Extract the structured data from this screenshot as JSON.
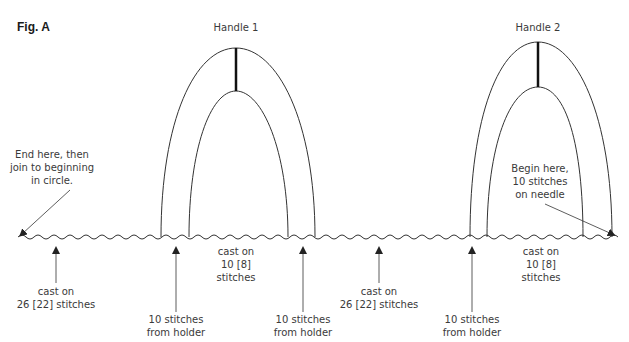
{
  "figure": {
    "label": "Fig. A",
    "handles": [
      {
        "title": "Handle 1"
      },
      {
        "title": "Handle 2"
      }
    ],
    "annotations": {
      "end": {
        "line1": "End here, then",
        "line2": "join to beginning",
        "line3": "in circle."
      },
      "begin": {
        "line1": "Begin here,",
        "line2": "10 stitches",
        "line3": "on needle"
      }
    },
    "bottom_labels": [
      {
        "line1": "cast on",
        "line2": "26 [22] stitches"
      },
      {
        "line1": "10 stitches",
        "line2": "from holder"
      },
      {
        "line1": "cast on",
        "line2": "10 [8]",
        "line3": "stitches"
      },
      {
        "line1": "10 stitches",
        "line2": "from holder"
      },
      {
        "line1": "cast on",
        "line2": "26 [22] stitches"
      },
      {
        "line1": "10 stitches",
        "line2": "from holder"
      },
      {
        "line1": "cast on",
        "line2": "10 [8]",
        "line3": "stitches"
      }
    ]
  }
}
